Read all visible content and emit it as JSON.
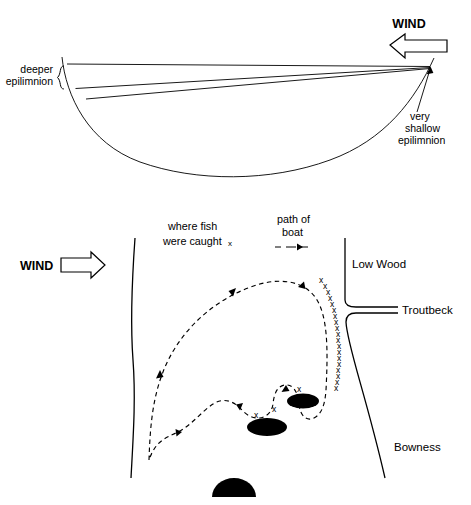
{
  "figure": {
    "title_present": false,
    "background_color": "#ffffff",
    "ink_color": "#000000",
    "panels": [
      {
        "id": "cross-section",
        "role": "lake-cross-section-diagram",
        "wind": {
          "label": "WIND",
          "arrow_direction": "left",
          "arrow_style": "hollow-outline"
        },
        "labels": {
          "deeper_epilimnion": "deeper\nepilimnion",
          "deeper_epilimnion_line1": "deeper",
          "deeper_epilimnion_line2": "epilimnion",
          "very_shallow_epilimnion_line1": "very",
          "very_shallow_epilimnion_line2": "shallow",
          "very_shallow_epilimnion_line3": "epilimnion"
        },
        "brace_side": "left",
        "thermocline_count": 2,
        "description_elements": [
          "water-surface-line",
          "lake-basin-curve",
          "upper-thermocline-line",
          "lower-thermocline-line"
        ]
      },
      {
        "id": "lake-map",
        "role": "lake-plan-view-map",
        "wind": {
          "label": "WIND",
          "arrow_direction": "right",
          "arrow_style": "hollow-outline"
        },
        "legend": [
          {
            "id": "fish-legend",
            "line1": "where fish",
            "line2": "were caught",
            "symbol": "x"
          },
          {
            "id": "boat-legend",
            "line1": "path of",
            "line2": "boat",
            "symbol": "dashed-arrow"
          }
        ],
        "place_labels": [
          {
            "id": "low-wood",
            "text": "Low Wood"
          },
          {
            "id": "troutbeck",
            "text": "Troutbeck"
          },
          {
            "id": "bowness",
            "text": "Bowness"
          }
        ],
        "islands": [
          {
            "id": "island-left",
            "shape": "ellipse",
            "fill": "#000000"
          },
          {
            "id": "island-right",
            "shape": "ellipse",
            "fill": "#000000"
          },
          {
            "id": "island-bottom",
            "shape": "half-dome",
            "fill": "#000000"
          }
        ],
        "boat_path": {
          "style": "dashed",
          "arrowhead_count": 6,
          "fish_mark_symbol": "x",
          "fish_mark_count": 24
        }
      }
    ]
  }
}
